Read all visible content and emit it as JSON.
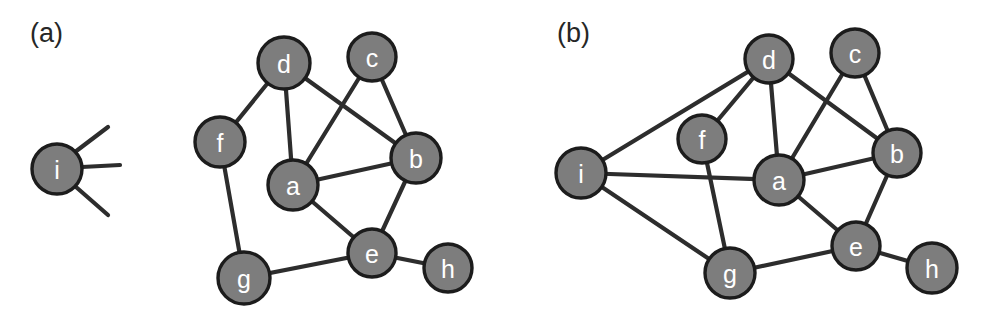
{
  "figure": {
    "background_color": "#ffffff",
    "node_fill_color": "#7d7d7d",
    "node_stroke_color": "#1c1c1c",
    "node_label_color": "#ffffff",
    "edge_color": "#2d2d2d"
  },
  "panels": [
    {
      "id": "panel-a",
      "label": "(a)",
      "label_x": 30,
      "label_y": 42,
      "detached": {
        "id": "i",
        "label": "i",
        "cx": 57,
        "cy": 169,
        "r": 25,
        "stubs": [
          {
            "x1": 75,
            "y1": 152,
            "x2": 108,
            "y2": 127
          },
          {
            "x1": 82,
            "y1": 167,
            "x2": 120,
            "y2": 165
          },
          {
            "x1": 76,
            "y1": 187,
            "x2": 108,
            "y2": 215
          }
        ]
      },
      "nodes": [
        {
          "id": "a",
          "label": "a",
          "cx": 293,
          "cy": 185,
          "r": 25
        },
        {
          "id": "b",
          "label": "b",
          "cx": 416,
          "cy": 158,
          "r": 25
        },
        {
          "id": "c",
          "label": "c",
          "cx": 372,
          "cy": 57,
          "r": 24
        },
        {
          "id": "d",
          "label": "d",
          "cx": 284,
          "cy": 63,
          "r": 26
        },
        {
          "id": "e",
          "label": "e",
          "cx": 372,
          "cy": 253,
          "r": 24
        },
        {
          "id": "f",
          "label": "f",
          "cx": 220,
          "cy": 142,
          "r": 25
        },
        {
          "id": "g",
          "label": "g",
          "cx": 244,
          "cy": 278,
          "r": 26
        },
        {
          "id": "h",
          "label": "h",
          "cx": 448,
          "cy": 268,
          "r": 24
        }
      ],
      "edges": [
        [
          "d",
          "f"
        ],
        [
          "d",
          "a"
        ],
        [
          "d",
          "b"
        ],
        [
          "c",
          "a"
        ],
        [
          "c",
          "b"
        ],
        [
          "a",
          "b"
        ],
        [
          "a",
          "e"
        ],
        [
          "b",
          "e"
        ],
        [
          "f",
          "g"
        ],
        [
          "g",
          "e"
        ],
        [
          "e",
          "h"
        ]
      ]
    },
    {
      "id": "panel-b",
      "label": "(b)",
      "label_x": 557,
      "label_y": 42,
      "nodes": [
        {
          "id": "a",
          "label": "a",
          "cx": 779,
          "cy": 180,
          "r": 25
        },
        {
          "id": "b",
          "label": "b",
          "cx": 897,
          "cy": 153,
          "r": 24
        },
        {
          "id": "c",
          "label": "c",
          "cx": 855,
          "cy": 53,
          "r": 24
        },
        {
          "id": "d",
          "label": "d",
          "cx": 769,
          "cy": 59,
          "r": 24
        },
        {
          "id": "e",
          "label": "e",
          "cx": 856,
          "cy": 246,
          "r": 24
        },
        {
          "id": "f",
          "label": "f",
          "cx": 702,
          "cy": 139,
          "r": 24
        },
        {
          "id": "g",
          "label": "g",
          "cx": 730,
          "cy": 273,
          "r": 25
        },
        {
          "id": "h",
          "label": "h",
          "cx": 932,
          "cy": 268,
          "r": 25
        },
        {
          "id": "i",
          "label": "i",
          "cx": 581,
          "cy": 173,
          "r": 25
        }
      ],
      "edges": [
        [
          "d",
          "f"
        ],
        [
          "d",
          "a"
        ],
        [
          "d",
          "b"
        ],
        [
          "d",
          "i"
        ],
        [
          "c",
          "a"
        ],
        [
          "c",
          "b"
        ],
        [
          "a",
          "b"
        ],
        [
          "a",
          "e"
        ],
        [
          "a",
          "i"
        ],
        [
          "b",
          "e"
        ],
        [
          "f",
          "g"
        ],
        [
          "g",
          "e"
        ],
        [
          "g",
          "i"
        ],
        [
          "e",
          "h"
        ]
      ]
    }
  ]
}
